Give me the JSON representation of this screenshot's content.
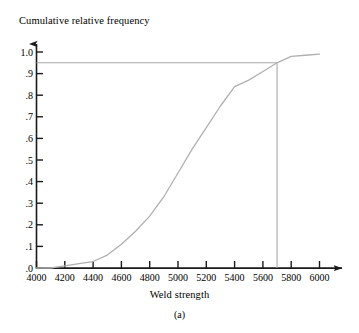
{
  "figure": {
    "caption": "(a)",
    "y_axis_title": "Cumulative relative frequency",
    "x_axis_title": "Weld strength"
  },
  "chart_data": {
    "type": "line",
    "title": "",
    "subtitle": "",
    "xlabel": "Weld strength",
    "ylabel": "Cumulative relative frequency",
    "xlim": [
      4000,
      6000
    ],
    "ylim": [
      0.0,
      1.0
    ],
    "xticks": [
      4000,
      4200,
      4400,
      4600,
      4800,
      5000,
      5200,
      5400,
      5600,
      5800,
      6000
    ],
    "xticklabels": [
      "4000",
      "4200",
      "4400",
      "4600",
      "4800",
      "5000",
      "5200",
      "5400",
      "5600",
      "5800",
      "6000"
    ],
    "yticks": [
      0.0,
      0.1,
      0.2,
      0.3,
      0.4,
      0.5,
      0.6,
      0.7,
      0.8,
      0.9,
      1.0
    ],
    "yticklabels": [
      ".0",
      ".1",
      ".2",
      ".3",
      ".4",
      ".5",
      ".6",
      ".7",
      ".8",
      ".9",
      "1.0"
    ],
    "grid": false,
    "legend": "none",
    "series": [
      {
        "name": "Cumulative relative frequency ogive",
        "color": "#b0b0b0",
        "x": [
          4000,
          4100,
          4200,
          4300,
          4400,
          4500,
          4600,
          4700,
          4800,
          4900,
          5000,
          5100,
          5200,
          5300,
          5400,
          5500,
          5600,
          5700,
          5800,
          5900,
          6000
        ],
        "y": [
          0.0,
          0.0,
          0.01,
          0.02,
          0.03,
          0.06,
          0.11,
          0.17,
          0.24,
          0.33,
          0.44,
          0.55,
          0.65,
          0.75,
          0.84,
          0.87,
          0.91,
          0.95,
          0.98,
          0.985,
          0.99
        ]
      }
    ],
    "annotations": [
      {
        "name": "reference-line-horizontal",
        "type": "hline",
        "y": 0.95,
        "x_start": 4000,
        "x_end": 5700,
        "color": "#a8a8a8",
        "label": ".95"
      },
      {
        "name": "reference-line-vertical",
        "type": "vline",
        "x": 5700,
        "y_start": 0.0,
        "y_end": 0.95,
        "color": "#a8a8a8",
        "label": "5700"
      }
    ]
  }
}
